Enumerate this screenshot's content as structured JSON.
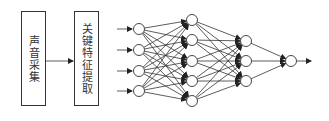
{
  "diagram": {
    "type": "pipeline + neural network",
    "boxes": [
      {
        "id": "sound-collection",
        "label": "声音采集"
      },
      {
        "id": "key-feature-extraction",
        "label": "关键特征提取"
      }
    ],
    "network": {
      "layers": [
        {
          "name": "input",
          "nodes": 4
        },
        {
          "name": "hidden1",
          "nodes": 5
        },
        {
          "name": "hidden2",
          "nodes": 3
        },
        {
          "name": "output",
          "nodes": 1
        }
      ],
      "input_arrows": 4,
      "output_arrows": 1,
      "connectivity": "fully-connected"
    },
    "colors": {
      "stroke": "#333333",
      "fill": "#ffffff"
    }
  }
}
